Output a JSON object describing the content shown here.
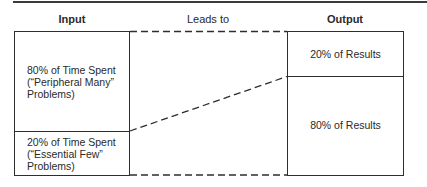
{
  "headers": {
    "input": "Input",
    "leads_to": "Leads to",
    "output": "Output"
  },
  "input_box": {
    "top_cell": {
      "lines": [
        "80% of Time Spent",
        "(“Peripheral Many”",
        "Problems)"
      ]
    },
    "bottom_cell": {
      "lines": [
        "20% of Time Spent",
        "(“Essential Few”",
        "Problems)"
      ]
    }
  },
  "output_box": {
    "top_cell": {
      "label": "20% of Results"
    },
    "bottom_cell": {
      "label": "80% of Results"
    }
  },
  "connectors": [
    {
      "from": "input-top",
      "to": "output-top",
      "style": "dashed"
    },
    {
      "from": "input-divider",
      "to": "output-divider",
      "style": "dashed"
    },
    {
      "from": "input-bottom",
      "to": "output-bottom",
      "style": "dashed"
    }
  ],
  "colors": {
    "line": "#2e2e2e",
    "text": "#2a2a2a",
    "background": "#ffffff"
  }
}
